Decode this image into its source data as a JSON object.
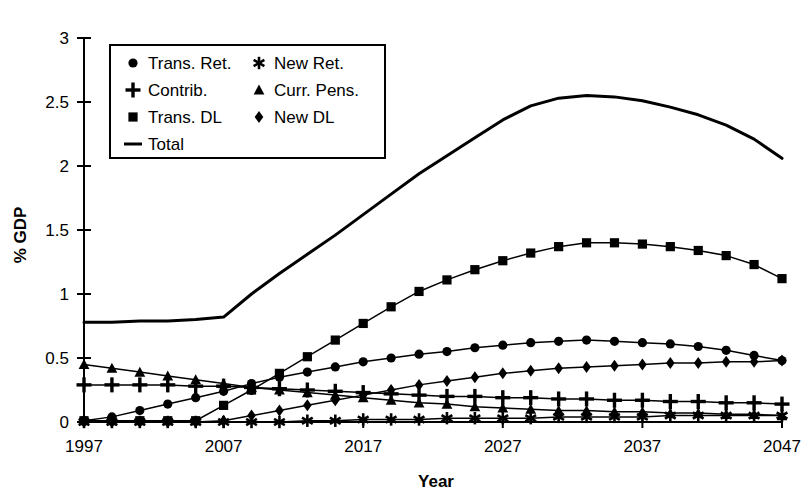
{
  "chart_data": {
    "type": "line",
    "title": "",
    "xlabel": "Year",
    "ylabel": "% GDP",
    "xlim": [
      1997,
      2047
    ],
    "ylim": [
      0,
      3
    ],
    "yticks": [
      0,
      0.5,
      1,
      1.5,
      2,
      2.5,
      3
    ],
    "ytick_labels": [
      "0",
      "0.5",
      "1",
      "1.5",
      "2",
      "2.5",
      "3"
    ],
    "xticks": [
      1997,
      2007,
      2017,
      2027,
      2037,
      2047
    ],
    "xtick_labels": [
      "1997",
      "2007",
      "2017",
      "2027",
      "2037",
      "2047"
    ],
    "grid": false,
    "legend_position": "upper-left",
    "x": [
      1997,
      1999,
      2001,
      2003,
      2005,
      2007,
      2009,
      2011,
      2013,
      2015,
      2017,
      2019,
      2021,
      2023,
      2025,
      2027,
      2029,
      2031,
      2033,
      2035,
      2037,
      2039,
      2041,
      2043,
      2045,
      2047
    ],
    "series": [
      {
        "name": "Trans. Ret.",
        "marker": "circle",
        "values": [
          0.01,
          0.04,
          0.09,
          0.14,
          0.19,
          0.24,
          0.3,
          0.35,
          0.39,
          0.43,
          0.47,
          0.5,
          0.53,
          0.55,
          0.58,
          0.6,
          0.62,
          0.63,
          0.64,
          0.63,
          0.62,
          0.61,
          0.59,
          0.56,
          0.52,
          0.48
        ]
      },
      {
        "name": "Contrib.",
        "marker": "plus",
        "values": [
          0.29,
          0.29,
          0.29,
          0.29,
          0.28,
          0.28,
          0.27,
          0.26,
          0.25,
          0.24,
          0.23,
          0.22,
          0.21,
          0.2,
          0.2,
          0.19,
          0.19,
          0.18,
          0.18,
          0.17,
          0.17,
          0.16,
          0.16,
          0.15,
          0.15,
          0.14
        ]
      },
      {
        "name": "Trans. DL",
        "marker": "square",
        "values": [
          0.01,
          0.01,
          0.01,
          0.01,
          0.01,
          0.13,
          0.25,
          0.38,
          0.51,
          0.64,
          0.77,
          0.9,
          1.02,
          1.11,
          1.19,
          1.26,
          1.32,
          1.37,
          1.4,
          1.4,
          1.39,
          1.37,
          1.34,
          1.3,
          1.23,
          1.12
        ]
      },
      {
        "name": "New Ret.",
        "marker": "star",
        "values": [
          0.0,
          0.0,
          0.0,
          0.0,
          0.0,
          0.0,
          0.0,
          0.0,
          0.01,
          0.01,
          0.02,
          0.02,
          0.02,
          0.03,
          0.03,
          0.03,
          0.03,
          0.04,
          0.04,
          0.04,
          0.04,
          0.05,
          0.05,
          0.05,
          0.05,
          0.05
        ]
      },
      {
        "name": "Curr. Pens.",
        "marker": "triangle",
        "values": [
          0.45,
          0.42,
          0.39,
          0.36,
          0.33,
          0.3,
          0.27,
          0.25,
          0.23,
          0.21,
          0.19,
          0.17,
          0.15,
          0.14,
          0.12,
          0.11,
          0.1,
          0.09,
          0.09,
          0.08,
          0.08,
          0.07,
          0.07,
          0.06,
          0.06,
          0.05
        ]
      },
      {
        "name": "New  DL",
        "marker": "diamond",
        "values": [
          0.0,
          0.0,
          0.0,
          0.0,
          0.0,
          0.01,
          0.05,
          0.09,
          0.13,
          0.17,
          0.21,
          0.25,
          0.29,
          0.32,
          0.35,
          0.38,
          0.4,
          0.42,
          0.43,
          0.44,
          0.45,
          0.46,
          0.46,
          0.47,
          0.47,
          0.48
        ]
      },
      {
        "name": "Total",
        "marker": "none",
        "values": [
          0.78,
          0.78,
          0.79,
          0.79,
          0.8,
          0.82,
          1.0,
          1.16,
          1.31,
          1.46,
          1.62,
          1.78,
          1.94,
          2.08,
          2.22,
          2.36,
          2.47,
          2.53,
          2.55,
          2.54,
          2.51,
          2.46,
          2.4,
          2.32,
          2.21,
          2.06
        ]
      }
    ],
    "legend": [
      {
        "label": "Trans. Ret.",
        "marker": "circle"
      },
      {
        "label": "New Ret.",
        "marker": "star"
      },
      {
        "label": "Contrib.",
        "marker": "plus"
      },
      {
        "label": "Curr. Pens.",
        "marker": "triangle"
      },
      {
        "label": "Trans. DL",
        "marker": "square"
      },
      {
        "label": "New  DL",
        "marker": "diamond"
      },
      {
        "label": "Total",
        "marker": "line"
      }
    ],
    "colors": {
      "line": "#000000",
      "background": "#ffffff",
      "axis": "#000000"
    }
  }
}
